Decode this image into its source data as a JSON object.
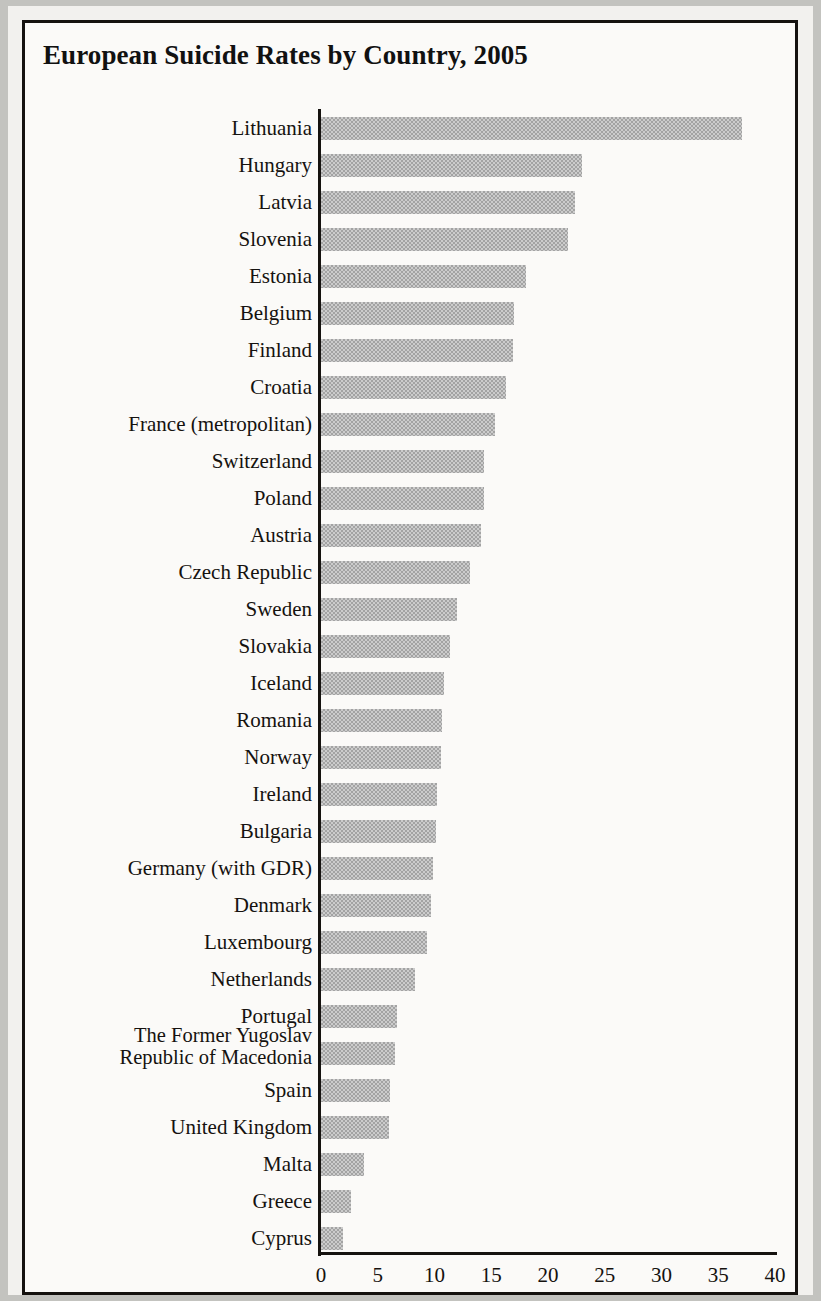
{
  "chart_data": {
    "type": "bar",
    "orientation": "horizontal",
    "title": "European Suicide Rates by Country, 2005",
    "xlabel": "per 100,000 inhabitants",
    "ylabel": "",
    "xlim": [
      0,
      40
    ],
    "xticks": [
      0,
      5,
      10,
      15,
      20,
      25,
      30,
      35,
      40
    ],
    "xtick_labels": [
      "0",
      "5",
      "10",
      "15",
      "20",
      "25",
      "30",
      "35",
      "40"
    ],
    "grid": false,
    "legend": "none",
    "bar_color": "#c0c0c0",
    "categories": [
      "Lithuania",
      "Hungary",
      "Latvia",
      "Slovenia",
      "Estonia",
      "Belgium",
      "Finland",
      "Croatia",
      "France (metropolitan)",
      "Switzerland",
      "Poland",
      "Austria",
      "Czech Republic",
      "Sweden",
      "Slovakia",
      "Iceland",
      "Romania",
      "Norway",
      "Ireland",
      "Bulgaria",
      "Germany (with GDR)",
      "Denmark",
      "Luxembourg",
      "Netherlands",
      "Portugal",
      "The Former Yugoslav\nRepublic of Macedonia",
      "Spain",
      "United Kingdom",
      "Malta",
      "Greece",
      "Cyprus"
    ],
    "values": [
      37.1,
      23.0,
      22.4,
      21.8,
      18.1,
      17.0,
      16.9,
      16.3,
      15.3,
      14.4,
      14.4,
      14.1,
      13.1,
      12.0,
      11.4,
      10.8,
      10.7,
      10.6,
      10.2,
      10.1,
      9.9,
      9.7,
      9.3,
      8.3,
      6.7,
      6.5,
      6.1,
      6.0,
      3.8,
      2.6,
      1.9
    ]
  }
}
